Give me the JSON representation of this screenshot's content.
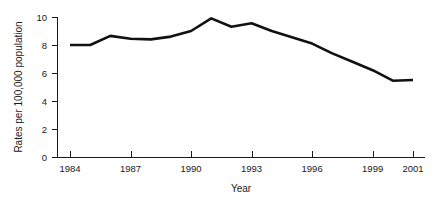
{
  "chart_data": {
    "type": "line",
    "title": "",
    "xlabel": "Year",
    "ylabel": "Rates per 100,000 population",
    "xlim": [
      1984,
      2001
    ],
    "ylim": [
      0,
      10
    ],
    "grid": false,
    "legend": null,
    "x_ticks": [
      "1984",
      "1987",
      "1990",
      "1993",
      "1996",
      "1999",
      "2001"
    ],
    "x_tick_values": [
      1984,
      1987,
      1990,
      1993,
      1996,
      1999,
      2001
    ],
    "y_ticks": [
      "0",
      "2",
      "4",
      "6",
      "8",
      "10"
    ],
    "y_tick_values": [
      0,
      2,
      4,
      6,
      8,
      10
    ],
    "x": [
      1984,
      1985,
      1986,
      1987,
      1988,
      1989,
      1990,
      1991,
      1992,
      1993,
      1994,
      1995,
      1996,
      1997,
      1998,
      1999,
      2000,
      2001
    ],
    "series": [
      {
        "name": "Rate",
        "color": "#111111",
        "values": [
          8.0,
          8.0,
          8.65,
          8.45,
          8.4,
          8.6,
          9.0,
          9.9,
          9.3,
          9.55,
          9.0,
          8.55,
          8.1,
          7.4,
          6.8,
          6.2,
          5.45,
          5.5
        ]
      }
    ]
  }
}
